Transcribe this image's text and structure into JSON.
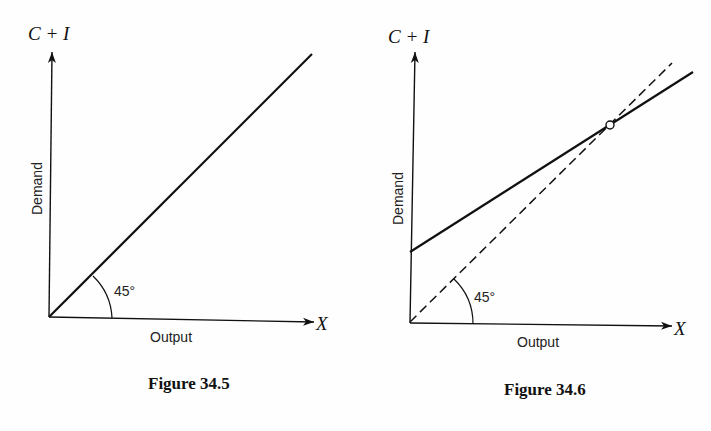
{
  "figures": [
    {
      "caption": "Figure 34.5",
      "y_axis_label": "C + I",
      "y_axis_title": "Demand",
      "x_axis_label": "X",
      "x_axis_title": "Output",
      "angle_label": "45°",
      "lines": [
        {
          "name": "45-degree line",
          "style": "solid"
        }
      ]
    },
    {
      "caption": "Figure 34.6",
      "y_axis_label": "C + I",
      "y_axis_title": "Demand",
      "x_axis_label": "X",
      "x_axis_title": "Output",
      "angle_label": "45°",
      "lines": [
        {
          "name": "45-degree line",
          "style": "dashed"
        },
        {
          "name": "C + I demand schedule",
          "style": "solid",
          "intercept": "positive",
          "slope": "less than 1"
        }
      ],
      "marker": {
        "name": "equilibrium point",
        "shape": "open circle"
      }
    }
  ],
  "colors": {
    "ink": "#111111",
    "background": "#fefefe"
  }
}
